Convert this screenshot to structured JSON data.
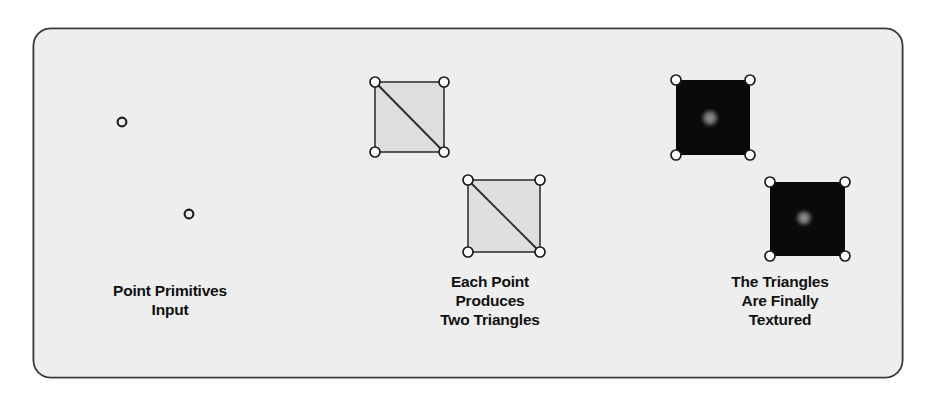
{
  "figure": {
    "panel": {
      "background_color": "#eeeeee",
      "border_color": "#3a3a3a",
      "corner_radius": 17,
      "bounds": {
        "x": 33,
        "y": 28,
        "width": 870,
        "height": 350
      }
    },
    "canvas_background": "#ffffff"
  },
  "stages": [
    {
      "id": "point-primitives",
      "caption": "Point Primitives\nInput",
      "shape_kind": "points",
      "points": [
        {
          "cx": 122,
          "cy": 122,
          "r": 4.5
        },
        {
          "cx": 189,
          "cy": 214,
          "r": 4.5
        }
      ],
      "point_fill": "#eeeeee",
      "point_stroke": "#1c1c1c"
    },
    {
      "id": "two-triangles",
      "caption": "Each Point\nProduces\nTwo Triangles",
      "shape_kind": "wireframe-quads",
      "quads": [
        {
          "x": 375,
          "y": 82,
          "width": 69,
          "height": 70
        },
        {
          "x": 468,
          "y": 180,
          "width": 72,
          "height": 72
        }
      ],
      "quad_fill": "#dedede",
      "quad_stroke": "#333333",
      "diagonal": "top-left-to-bottom-right",
      "vertex_fill": "#ffffff",
      "vertex_stroke": "#1c1c1c",
      "vertex_radius": 5
    },
    {
      "id": "textured-quads",
      "caption": "The Triangles\nAre Finally\nTextured",
      "shape_kind": "textured-quads",
      "quads": [
        {
          "x": 676,
          "y": 80,
          "width": 74,
          "height": 75,
          "blob_cx": 710,
          "blob_cy": 118,
          "blob_r": 9
        },
        {
          "x": 770,
          "y": 182,
          "width": 75,
          "height": 74,
          "blob_cx": 804,
          "blob_cy": 218,
          "blob_r": 8.5
        }
      ],
      "quad_fill": "#0a0a0a",
      "blob_center_color": "#8c8c8c",
      "blob_edge_color": "#0a0a0a",
      "vertex_fill": "#ffffff",
      "vertex_stroke": "#1c1c1c",
      "vertex_radius": 5
    }
  ],
  "captions": {
    "input": "Point Primitives\nInput",
    "triangles": "Each Point\nProduces\nTwo Triangles",
    "textured": "The Triangles\nAre Finally\nTextured"
  }
}
